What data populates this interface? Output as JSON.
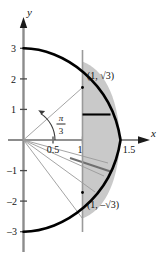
{
  "figure": {
    "name": "conic-section-polar-graph",
    "axes": {
      "x_axis_label": "x",
      "y_axis_label": "y",
      "x_ticks": [
        {
          "value": 0.5,
          "label": "0.5"
        },
        {
          "value": 1,
          "label": "1"
        },
        {
          "value": 1.5,
          "label": "1.5"
        }
      ],
      "y_ticks": [
        {
          "value": 3,
          "label": "3"
        },
        {
          "value": 2,
          "label": "2"
        },
        {
          "value": 1,
          "label": "1"
        },
        {
          "value": -1,
          "label": "–1"
        },
        {
          "value": -2,
          "label": "–2"
        },
        {
          "value": -3,
          "label": "–3"
        }
      ]
    },
    "point_labels": [
      {
        "id": "upper-point",
        "text": "(1, √3)",
        "x": 1,
        "y": 1.7320508
      },
      {
        "id": "lower-point",
        "text": "(1, –√3)",
        "x": 1,
        "y": -1.7320508
      }
    ],
    "angle_label": {
      "numerator": "π",
      "denominator": "3",
      "value_radians": 1.0471976
    },
    "colors": {
      "curve": "#000000",
      "axis": "#8c8c8c",
      "shade_fill": "#c9c9c9",
      "thin_line": "#9a9a9a",
      "text": "#111111"
    },
    "shaded_region": {
      "description": "region bounded left by the vertical line x = 1 and right by the curve",
      "x_left": 1,
      "y_from": -1.7320508,
      "y_to": 1.7320508
    },
    "vertical_line": {
      "x": 1
    },
    "chord_segment": {
      "x_from": 1,
      "x_to": 1.27,
      "y": 0.82
    }
  }
}
